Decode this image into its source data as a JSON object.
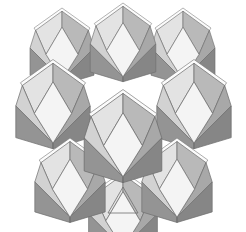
{
  "figure": {
    "title": "Rhombic dodecahedra space-filling packing",
    "background_color": "#ffffff",
    "stroke_color": "#6e6e6e",
    "solid_count": 9,
    "faces_per_solid": 12,
    "visible_faces_per_solid": 7
  },
  "palette": {
    "face_white": "#f4f4f4",
    "face_light": "#e3e3e3",
    "face_light_gray": "#d2d2d2",
    "face_mid": "#b9b9b9",
    "face_mid_dark": "#a8a8a8",
    "face_dark": "#949494",
    "face_darkest": "#868686",
    "cap_highlight": "#fbfbfb",
    "outline": "#6e6e6e"
  },
  "chart_data": {
    "type": "diagram",
    "title": "Rhombic dodecahedra space-filling packing",
    "projection": "isometric",
    "lattice": {
      "rows": 3,
      "row_labels": [
        "back",
        "middle",
        "front"
      ],
      "columns_per_row": 3,
      "stagger": "offset half-cell per row"
    },
    "cells": [
      {
        "id": "back-left",
        "row": "back",
        "col": 1,
        "cx": 62,
        "cy": 48,
        "scale": 0.8,
        "z": 1
      },
      {
        "id": "back-center",
        "row": "back",
        "col": 2,
        "cx": 123,
        "cy": 44,
        "scale": 0.82,
        "z": 2
      },
      {
        "id": "back-right",
        "row": "back",
        "col": 3,
        "cx": 183,
        "cy": 48,
        "scale": 0.8,
        "z": 1
      },
      {
        "id": "mid-left",
        "row": "middle",
        "col": 1,
        "cx": 53,
        "cy": 106,
        "scale": 0.93,
        "z": 4
      },
      {
        "id": "mid-center",
        "row": "middle",
        "col": 2,
        "cx": 123,
        "cy": 138,
        "scale": 0.97,
        "z": 6
      },
      {
        "id": "mid-right",
        "row": "middle",
        "col": 3,
        "cx": 194,
        "cy": 106,
        "scale": 0.93,
        "z": 4
      },
      {
        "id": "front-left",
        "row": "front",
        "col": 1,
        "cx": 70,
        "cy": 182,
        "scale": 0.88,
        "z": 5
      },
      {
        "id": "front-center",
        "row": "front",
        "col": 2,
        "cx": 123,
        "cy": 214,
        "scale": 0.86,
        "z": 3
      },
      {
        "id": "front-right",
        "row": "front",
        "col": 3,
        "cx": 177,
        "cy": 182,
        "scale": 0.88,
        "z": 5
      }
    ],
    "face_shading": [
      {
        "name": "top-left-rhombus",
        "fill": "#e3e3e3"
      },
      {
        "name": "top-right-rhombus",
        "fill": "#b9b9b9"
      },
      {
        "name": "upper-left-rhombus",
        "fill": "#d2d2d2"
      },
      {
        "name": "center-rhombus",
        "fill": "#f4f4f4"
      },
      {
        "name": "upper-right-rhombus",
        "fill": "#a8a8a8"
      },
      {
        "name": "lower-left-rhombus",
        "fill": "#949494"
      },
      {
        "name": "lower-right-rhombus",
        "fill": "#868686"
      }
    ],
    "annotations": [
      {
        "name": "bottom-center-notch",
        "shape": "triangular gap",
        "x": 123,
        "y": 205
      }
    ]
  }
}
